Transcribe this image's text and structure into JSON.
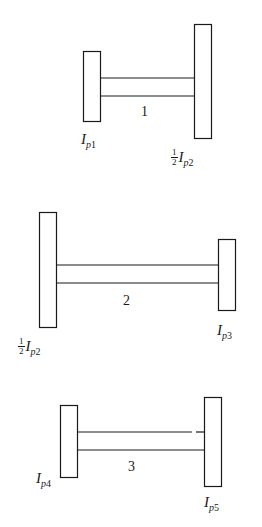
{
  "figure": {
    "type": "torsional-shaft-system-diagram",
    "stroke_color": "#1a1a1a",
    "background": "#ffffff"
  },
  "systems": [
    {
      "shaft_label": "1",
      "left_disk": {
        "fraction": null,
        "symbol": "I",
        "sub_p": "p",
        "sub_n": "1"
      },
      "right_disk": {
        "fraction": {
          "num": "1",
          "den": "2"
        },
        "symbol": "I",
        "sub_p": "p",
        "sub_n": "2"
      }
    },
    {
      "shaft_label": "2",
      "left_disk": {
        "fraction": {
          "num": "1",
          "den": "2"
        },
        "symbol": "I",
        "sub_p": "p",
        "sub_n": "2"
      },
      "right_disk": {
        "fraction": null,
        "symbol": "I",
        "sub_p": "p",
        "sub_n": "3"
      }
    },
    {
      "shaft_label": "3",
      "left_disk": {
        "fraction": null,
        "symbol": "I",
        "sub_p": "p",
        "sub_n": "4"
      },
      "right_disk": {
        "fraction": null,
        "symbol": "I",
        "sub_p": "p",
        "sub_n": "5"
      }
    }
  ]
}
